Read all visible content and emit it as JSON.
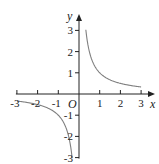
{
  "chart_data": {
    "type": "line",
    "title": "",
    "function": "y = 1/x",
    "xlabel": "x",
    "ylabel": "y",
    "origin_label": "O",
    "xlim": [
      -3,
      3
    ],
    "ylim": [
      -3,
      3
    ],
    "grid": false,
    "x_ticks": [
      -3,
      -2,
      -1,
      1,
      2,
      3
    ],
    "y_ticks": [
      -3,
      -2,
      -1,
      1,
      2,
      3
    ],
    "x_tick_labels": [
      "-3",
      "-2",
      "-1",
      "1",
      "2",
      "3"
    ],
    "y_tick_labels": [
      "-3",
      "-2",
      "-1",
      "1",
      "2",
      "3"
    ],
    "series": [
      {
        "name": "y=1/x (x>0)",
        "x": [
          0.33,
          0.4,
          0.5,
          0.75,
          1,
          1.5,
          2,
          2.5,
          3
        ],
        "y": [
          3.03,
          2.5,
          2,
          1.33,
          1,
          0.67,
          0.5,
          0.4,
          0.33
        ]
      },
      {
        "name": "y=1/x (x<0)",
        "x": [
          -3,
          -2.5,
          -2,
          -1.5,
          -1,
          -0.75,
          -0.5,
          -0.4,
          -0.33
        ],
        "y": [
          -0.33,
          -0.4,
          -0.5,
          -0.67,
          -1,
          -1.33,
          -2,
          -2.5,
          -3.03
        ]
      }
    ],
    "colors": {
      "axis": "#222222",
      "curve": "#808080"
    }
  }
}
